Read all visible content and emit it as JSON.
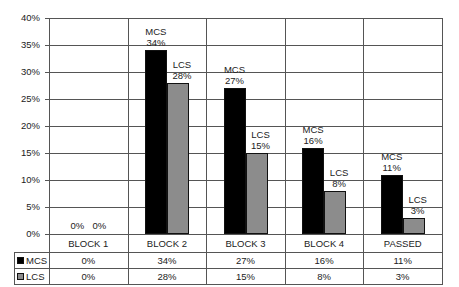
{
  "chart_data": {
    "type": "bar",
    "title": "",
    "xlabel": "",
    "ylabel": "",
    "ylim": [
      0,
      40
    ],
    "yticks": [
      "0%",
      "5%",
      "10%",
      "15%",
      "20%",
      "25%",
      "30%",
      "35%",
      "40%"
    ],
    "categories": [
      "BLOCK  1",
      "BLOCK 2",
      "BLOCK 3",
      "BLOCK 4",
      "PASSED"
    ],
    "series": [
      {
        "name": "MCS",
        "color": "#000000",
        "values": [
          0,
          34,
          27,
          16,
          11
        ],
        "labels": [
          "0%",
          "34%",
          "27%",
          "16%",
          "11%"
        ]
      },
      {
        "name": "LCS",
        "color": "#8c8c8c",
        "values": [
          0,
          28,
          15,
          8,
          3
        ],
        "labels": [
          "0%",
          "28%",
          "15%",
          "8%",
          "3%"
        ]
      }
    ],
    "grid": true,
    "legend_position": "data-table-left",
    "data_table": true
  }
}
